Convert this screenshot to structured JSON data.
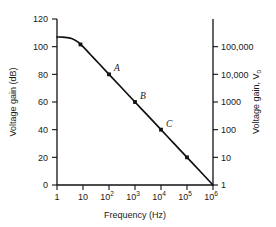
{
  "chart_data": {
    "type": "line",
    "title": "",
    "xlabel": "Frequency (Hz)",
    "ylabel": "Voltage gain (dB)",
    "y2label": "Voltage gain, V",
    "y2label_sub": "o",
    "xscale": "log",
    "xlim": [
      1,
      1000000
    ],
    "ylim": [
      0,
      120
    ],
    "y2lim": [
      1,
      1000000
    ],
    "grid": false,
    "legend": "none",
    "xticks": [
      {
        "value": 1,
        "label": "1",
        "sup": ""
      },
      {
        "value": 10,
        "label": "10",
        "sup": ""
      },
      {
        "value": 100,
        "label": "10",
        "sup": "2"
      },
      {
        "value": 1000,
        "label": "10",
        "sup": "3"
      },
      {
        "value": 10000,
        "label": "10",
        "sup": "4"
      },
      {
        "value": 100000,
        "label": "10",
        "sup": "5"
      },
      {
        "value": 1000000,
        "label": "10",
        "sup": "6"
      }
    ],
    "yticks": [
      {
        "value": 0,
        "label": "0"
      },
      {
        "value": 20,
        "label": "20"
      },
      {
        "value": 40,
        "label": "40"
      },
      {
        "value": 60,
        "label": "60"
      },
      {
        "value": 80,
        "label": "80"
      },
      {
        "value": 100,
        "label": "100"
      },
      {
        "value": 120,
        "label": "120"
      }
    ],
    "y2ticks": [
      {
        "db": 0,
        "label": "1"
      },
      {
        "db": 20,
        "label": "10"
      },
      {
        "db": 40,
        "label": "100"
      },
      {
        "db": 60,
        "label": "1000"
      },
      {
        "db": 80,
        "label": "10,000"
      },
      {
        "db": 100,
        "label": "100,000"
      }
    ],
    "series": [
      {
        "name": "open-loop gain",
        "color": "#111111",
        "points": [
          {
            "freq": 1,
            "db": 107
          },
          {
            "freq": 1.6,
            "db": 106.9
          },
          {
            "freq": 2.5,
            "db": 106.6
          },
          {
            "freq": 3.2,
            "db": 106.2
          },
          {
            "freq": 4,
            "db": 105.6
          },
          {
            "freq": 5,
            "db": 104.7
          },
          {
            "freq": 6.3,
            "db": 103.4
          },
          {
            "freq": 8,
            "db": 101.6
          },
          {
            "freq": 10,
            "db": 100
          },
          {
            "freq": 20,
            "db": 94
          },
          {
            "freq": 40,
            "db": 88
          },
          {
            "freq": 100,
            "db": 80
          },
          {
            "freq": 300,
            "db": 70.5
          },
          {
            "freq": 1000,
            "db": 60
          },
          {
            "freq": 3000,
            "db": 50.5
          },
          {
            "freq": 10000,
            "db": 40
          },
          {
            "freq": 30000,
            "db": 30.5
          },
          {
            "freq": 100000,
            "db": 20
          },
          {
            "freq": 300000,
            "db": 10.5
          },
          {
            "freq": 1000000,
            "db": 0
          }
        ]
      }
    ],
    "markers": [
      {
        "freq": 8,
        "db": 101.6,
        "label": ""
      },
      {
        "freq": 100,
        "db": 80,
        "label": "A"
      },
      {
        "freq": 1000,
        "db": 60,
        "label": "B"
      },
      {
        "freq": 10000,
        "db": 40,
        "label": "C"
      },
      {
        "freq": 100000,
        "db": 20,
        "label": ""
      }
    ],
    "annotations": [
      {
        "text": "A",
        "freq": 100,
        "db": 80
      },
      {
        "text": "B",
        "freq": 1000,
        "db": 60
      },
      {
        "text": "C",
        "freq": 10000,
        "db": 40
      }
    ]
  }
}
